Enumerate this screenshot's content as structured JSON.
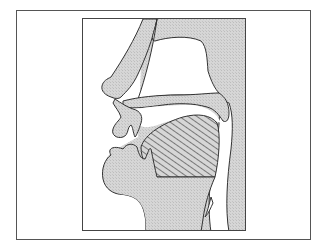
{
  "diagram": {
    "colors": {
      "background": "#ffffff",
      "tissue_fill": "#d4d4d4",
      "outline": "#333333",
      "frame": "#555555",
      "hatch": "#444444"
    },
    "regions": [
      {
        "name": "nasal-cavity",
        "fill": "white"
      },
      {
        "name": "nose",
        "fill": "stippled"
      },
      {
        "name": "hard-palate",
        "fill": "stippled"
      },
      {
        "name": "velum",
        "fill": "stippled"
      },
      {
        "name": "upper-lip",
        "fill": "stippled"
      },
      {
        "name": "lower-lip-and-jaw",
        "fill": "stippled"
      },
      {
        "name": "tongue-body",
        "fill": "hatched"
      },
      {
        "name": "pharynx",
        "fill": "white"
      },
      {
        "name": "epiglottis",
        "fill": "stippled"
      }
    ]
  }
}
